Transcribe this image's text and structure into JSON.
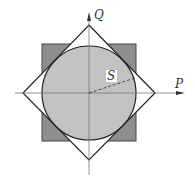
{
  "diagram": {
    "axes": {
      "horizontal_label": "P",
      "vertical_label": "Q"
    },
    "radius_label": "S",
    "shapes": [
      {
        "name": "square",
        "fill": "#8e8e8e",
        "stroke": "#444444"
      },
      {
        "name": "circle",
        "fill": "#c2c2c2",
        "stroke": "#222222"
      },
      {
        "name": "diamond",
        "fill": "none",
        "stroke": "#222222"
      }
    ],
    "colors": {
      "square_fill": "#8e8e8e",
      "circle_fill": "#c2c2c2",
      "line": "#222222",
      "axis": "#777777",
      "background": "#ffffff"
    }
  }
}
